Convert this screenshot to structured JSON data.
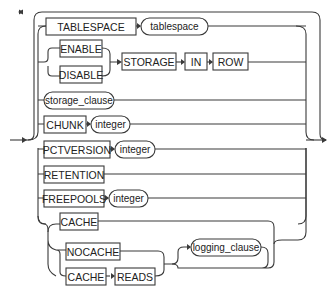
{
  "diagram": {
    "type": "railroad-syntax-diagram",
    "rows": [
      {
        "items": [
          {
            "kind": "keyword",
            "text": "TABLESPACE"
          },
          {
            "kind": "nonterminal",
            "text": "tablespace"
          }
        ]
      },
      {
        "items": [
          {
            "kind": "choice",
            "options": [
              "ENABLE",
              "DISABLE"
            ]
          },
          {
            "kind": "keyword",
            "text": "STORAGE"
          },
          {
            "kind": "keyword",
            "text": "IN"
          },
          {
            "kind": "keyword",
            "text": "ROW"
          }
        ]
      },
      {
        "items": [
          {
            "kind": "nonterminal",
            "text": "storage_clause"
          }
        ]
      },
      {
        "items": [
          {
            "kind": "keyword",
            "text": "CHUNK"
          },
          {
            "kind": "nonterminal",
            "text": "integer"
          }
        ]
      },
      {
        "items": [
          {
            "kind": "keyword",
            "text": "PCTVERSION"
          },
          {
            "kind": "nonterminal",
            "text": "integer"
          }
        ]
      },
      {
        "items": [
          {
            "kind": "keyword",
            "text": "RETENTION"
          }
        ]
      },
      {
        "items": [
          {
            "kind": "keyword",
            "text": "FREEPOOLS"
          },
          {
            "kind": "nonterminal",
            "text": "integer"
          }
        ]
      },
      {
        "items": [
          {
            "kind": "choice",
            "options": [
              "CACHE",
              "NOCACHE",
              "CACHE READS"
            ]
          },
          {
            "kind": "optional",
            "text": "logging_clause"
          }
        ]
      }
    ],
    "labels": {
      "tablespace_kw": "TABLESPACE",
      "tablespace_nt": "tablespace",
      "enable": "ENABLE",
      "disable": "DISABLE",
      "storage": "STORAGE",
      "in": "IN",
      "row": "ROW",
      "storage_clause": "storage_clause",
      "chunk": "CHUNK",
      "chunk_integer": "integer",
      "pctversion": "PCTVERSION",
      "pctversion_integer": "integer",
      "retention": "RETENTION",
      "freepools": "FREEPOOLS",
      "freepools_integer": "integer",
      "cache": "CACHE",
      "nocache": "NOCACHE",
      "cache2": "CACHE",
      "reads": "READS",
      "logging_clause": "logging_clause"
    },
    "colors": {
      "line": "#3a3a3a",
      "text": "#222222",
      "background": "#ffffff"
    }
  }
}
